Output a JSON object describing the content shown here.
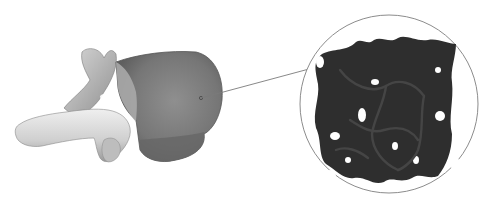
{
  "figure": {
    "vertebra": {
      "label": "vertebra",
      "fill": "#8a8a8a",
      "highlight": "#d8d8d8",
      "shadow": "#5e5e5e"
    },
    "callout": {
      "line_color": "#7a7a7a",
      "anchor": {
        "x": 201,
        "y": 98
      },
      "end": {
        "x": 309,
        "y": 69
      },
      "circle": {
        "cx": 389,
        "cy": 104,
        "r": 89,
        "stroke": "#8c8c8c"
      }
    },
    "trabecular": {
      "label": "trabecular bone",
      "fill": "#2e2e2e",
      "strut": "#3c3c3c"
    }
  }
}
